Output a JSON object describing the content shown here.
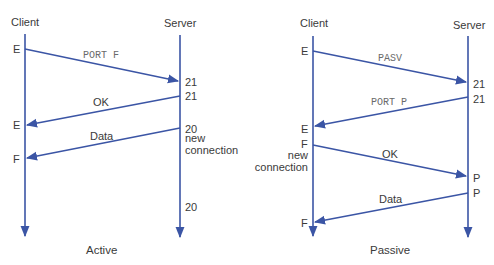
{
  "colors": {
    "line": "#3b55a5",
    "text": "#3a3a3a",
    "mono_text": "#6a6a6a"
  },
  "active": {
    "caption": "Active",
    "client_label": "Client",
    "server_label": "Server",
    "client_ports": [
      "E",
      "E",
      "F"
    ],
    "server_ports": [
      "21",
      "21",
      "20",
      "20"
    ],
    "server_note": "new\nconnection",
    "server_note_line1": "new",
    "server_note_line2": "connection",
    "messages": [
      {
        "label": "PORT F",
        "from": "client",
        "to": "server",
        "style": "mono"
      },
      {
        "label": "OK",
        "from": "server",
        "to": "client",
        "style": "sans"
      },
      {
        "label": "Data",
        "from": "server",
        "to": "client",
        "style": "sans"
      }
    ]
  },
  "passive": {
    "caption": "Passive",
    "client_label": "Client",
    "server_label": "Server",
    "client_ports": [
      "E",
      "E",
      "F",
      "F"
    ],
    "server_ports": [
      "21",
      "21",
      "P",
      "P"
    ],
    "client_note_line1": "new",
    "client_note_line2": "connection",
    "messages": [
      {
        "label": "PASV",
        "from": "client",
        "to": "server",
        "style": "mono"
      },
      {
        "label": "PORT P",
        "from": "server",
        "to": "client",
        "style": "mono"
      },
      {
        "label": "OK",
        "from": "client",
        "to": "server",
        "style": "sans"
      },
      {
        "label": "Data",
        "from": "server",
        "to": "client",
        "style": "sans"
      }
    ]
  }
}
